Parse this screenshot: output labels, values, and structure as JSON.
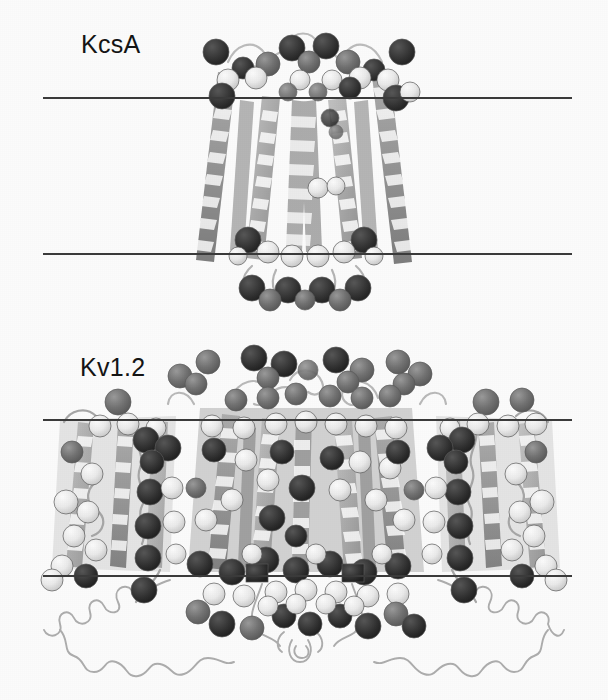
{
  "figure": {
    "width": 608,
    "height": 700,
    "background_color": "#ffffff"
  },
  "panels": [
    {
      "id": "kcsa",
      "label": "KcsA",
      "label_x": 81,
      "label_y": 30,
      "membrane_top_y": 97,
      "membrane_bottom_y": 253,
      "membrane_x_start": 43,
      "membrane_x_end": 572,
      "shape": "inverted-cone / teepee bundle of transmembrane helices",
      "protein_x_center": 304,
      "protein_top_y": 30,
      "protein_bottom_y": 312
    },
    {
      "id": "kv12",
      "label": "Kv1.2",
      "label_x": 80,
      "label_y": 353,
      "membrane_top_y": 419,
      "membrane_bottom_y": 575,
      "membrane_x_start": 43,
      "membrane_x_end": 572,
      "shape": "central pore domain flanked by two peripheral voltage-sensor domains, with extended coils below the membrane",
      "protein_x_center": 304,
      "protein_top_y": 355,
      "protein_bottom_y": 675
    }
  ],
  "colors": {
    "membrane_line": "#3c3c3c",
    "label_text": "#151515",
    "cartoon_helix_light": "#b8b8b8",
    "cartoon_helix_mid": "#9a9a9a",
    "cartoon_helix_dark": "#7d7d7d",
    "coil_loop": "#a8a8a8",
    "sphere_dark": "#343434",
    "sphere_mid": "#6e6e6e",
    "sphere_light": "#ebebeb",
    "sphere_outline": "#555555",
    "background": "#ffffff"
  },
  "legend_semantics": {
    "dark_spheres": "negatively charged / acidic residue side chains",
    "light_spheres": "positively charged / basic residue side chains",
    "mid_spheres": "intermediate-shaded residue side chains",
    "horizontal_lines": "membrane boundaries (hydrophobic slab)"
  }
}
